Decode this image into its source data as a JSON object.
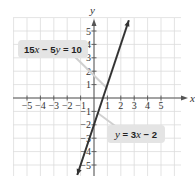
{
  "chart_data": {
    "type": "line",
    "title": "",
    "xlabel": "x",
    "ylabel": "y",
    "xlim": [
      -5.5,
      6
    ],
    "ylim": [
      -6,
      5.8
    ],
    "x_ticks": [
      -5,
      -4,
      -3,
      -2,
      -1,
      1,
      2,
      3,
      4,
      5
    ],
    "y_ticks": [
      -5,
      -4,
      -3,
      -2,
      -1,
      1,
      2,
      3,
      4,
      5
    ],
    "x_tick_labels": [
      "−5",
      "−4",
      "−3",
      "−2",
      "−1",
      "1",
      "2",
      "3",
      "4",
      "5"
    ],
    "y_tick_labels": [
      "5",
      "4",
      "3",
      "2",
      "1",
      "−1",
      "−2",
      "−3",
      "−4",
      "−5"
    ],
    "grid": true,
    "series": [
      {
        "name": "15x − 5y = 10 (y = 3x − 2)",
        "equation": "y = 3x - 2",
        "x": [
          -1.25,
          2.6
        ],
        "y": [
          -5.75,
          5.8
        ],
        "color": "#333333"
      }
    ],
    "annotations": [
      {
        "text": "15x − 5y = 10",
        "position": "upper-left",
        "points_to": [
          0.9,
          0.8
        ]
      },
      {
        "text": "y = 3x − 2",
        "position": "lower-right",
        "points_to": [
          0.3,
          -1.1
        ]
      }
    ]
  },
  "labels": {
    "eq1_prefix": "15",
    "eq1_x": "x",
    "eq1_mid": " − 5",
    "eq1_y": "y",
    "eq1_suffix": " = 10",
    "eq2_y": "y",
    "eq2_mid": " = 3",
    "eq2_x": "x",
    "eq2_suffix": " − 2",
    "x_axis": "x",
    "y_axis": "y"
  }
}
